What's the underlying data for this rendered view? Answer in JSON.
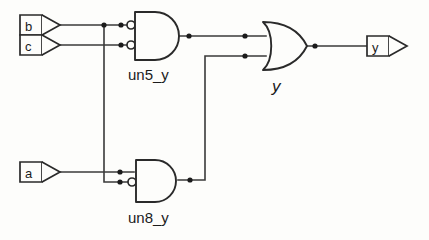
{
  "diagram": {
    "background_color": "#fdfdfb",
    "line_color": "#3a3a3a",
    "text_color": "#1b1b1b"
  },
  "input_ports": [
    {
      "name": "b",
      "label": "b",
      "shape": "input-port-arrow"
    },
    {
      "name": "c",
      "label": "c",
      "shape": "input-port-arrow"
    },
    {
      "name": "a",
      "label": "a",
      "shape": "input-port-arrow"
    }
  ],
  "output_ports": [
    {
      "name": "y",
      "label": "y",
      "shape": "output-port-arrow"
    }
  ],
  "gates": [
    {
      "id": "un5_y",
      "label": "un5_y",
      "type": "and",
      "inverted_inputs": [
        true,
        true
      ],
      "inverted_output": false,
      "inputs": [
        "b",
        "c"
      ]
    },
    {
      "id": "un8_y",
      "label": "un8_y",
      "type": "and",
      "inverted_inputs": [
        false,
        true
      ],
      "inverted_output": false,
      "inputs": [
        "a",
        "b"
      ]
    },
    {
      "id": "y",
      "label": "y",
      "type": "or",
      "inverted_inputs": [
        false,
        false
      ],
      "inverted_output": false,
      "inputs": [
        "un5_y",
        "un8_y"
      ]
    }
  ],
  "nets": [
    {
      "name": "b",
      "from": "b",
      "to": [
        "un5_y.in0",
        "un8_y.in1"
      ]
    },
    {
      "name": "c",
      "from": "c",
      "to": [
        "un5_y.in1"
      ]
    },
    {
      "name": "a",
      "from": "a",
      "to": [
        "un8_y.in0"
      ]
    },
    {
      "name": "un5_y",
      "from": "un5_y.out",
      "to": [
        "y.in0"
      ]
    },
    {
      "name": "un8_y",
      "from": "un8_y.out",
      "to": [
        "y.in1"
      ]
    },
    {
      "name": "y",
      "from": "y.out",
      "to": [
        "y_port"
      ]
    }
  ]
}
